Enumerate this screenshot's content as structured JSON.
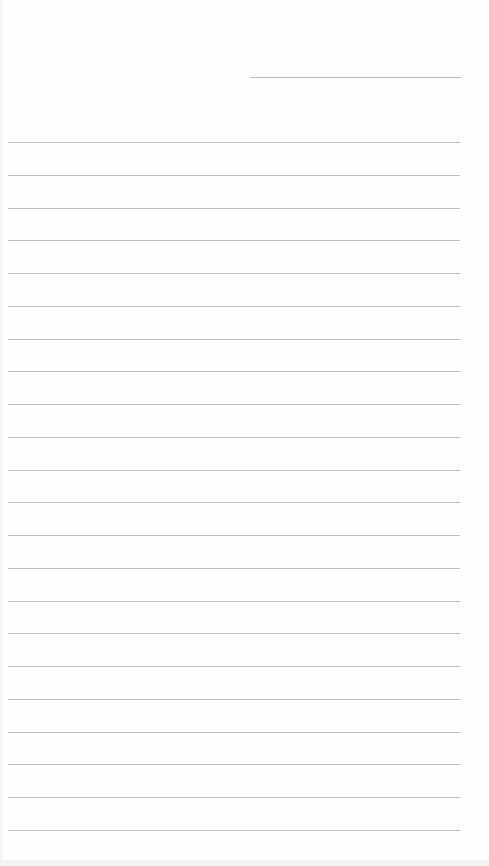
{
  "page": {
    "type": "lined-paper",
    "date_line": {
      "present": true,
      "text": ""
    },
    "ruled_lines": {
      "count": 22,
      "first_y": 142,
      "spacing": 32.76,
      "color": "#bdbdbd"
    },
    "lines": [
      "",
      "",
      "",
      "",
      "",
      "",
      "",
      "",
      "",
      "",
      "",
      "",
      "",
      "",
      "",
      "",
      "",
      "",
      "",
      "",
      "",
      ""
    ]
  }
}
